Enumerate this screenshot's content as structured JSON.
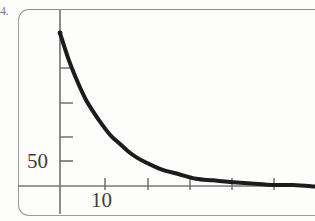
{
  "figure": {
    "marker": "4.",
    "frame": {
      "style": "rounded-rectangle",
      "stroke_color": "#9a9a9a"
    }
  },
  "axes": {
    "x_axis_label": "10",
    "y_axis_label": "50",
    "x_axis_color": "#6b6b6b",
    "y_axis_color": "#6b6b6b"
  },
  "chart_data": {
    "type": "line",
    "title": "",
    "subtitle": "",
    "xlabel": "",
    "ylabel": "",
    "grid": false,
    "legend": null,
    "legend_position": "none",
    "series": [
      {
        "name": "decay",
        "color": "#1c1c1c",
        "line_width": 4,
        "x": [
          0,
          2,
          4,
          6,
          8,
          10,
          12,
          14,
          16,
          18,
          20,
          24,
          28,
          32,
          36,
          40,
          45,
          50,
          55,
          60
        ],
        "y": [
          100,
          83,
          69,
          57,
          48,
          40,
          33,
          28,
          23,
          19,
          16,
          11,
          8,
          5,
          4,
          3,
          2,
          1,
          1,
          0
        ]
      }
    ],
    "x_ticks": [
      0,
      10,
      20,
      30,
      40,
      50
    ],
    "x_tick_labels": [
      "",
      "10",
      "",
      "",
      "",
      ""
    ],
    "y_ticks": [
      25,
      50,
      75,
      100
    ],
    "y_tick_labels": [
      "",
      "50",
      "",
      ""
    ],
    "xlim": [
      0,
      60
    ],
    "ylim": [
      0,
      110
    ],
    "annotations": []
  }
}
